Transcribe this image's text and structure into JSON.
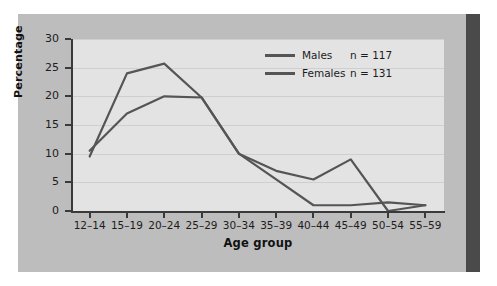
{
  "chart_data": {
    "type": "line",
    "title": "",
    "xlabel": "Age group",
    "ylabel": "Percentage",
    "categories": [
      "12–14",
      "15–19",
      "20–24",
      "25–29",
      "30–34",
      "35–39",
      "40–44",
      "45–49",
      "50–54",
      "55–59"
    ],
    "ylim": [
      0,
      30
    ],
    "yticks": [
      0,
      5,
      10,
      15,
      20,
      25,
      30
    ],
    "grid": true,
    "legend_position": "top-right",
    "series": [
      {
        "name": "Males",
        "n_label": "n = 117",
        "n": 117,
        "color": "#555555",
        "values": [
          10.5,
          17.0,
          20.0,
          19.8,
          10.0,
          7.0,
          5.5,
          9.0,
          0.0,
          1.0
        ]
      },
      {
        "name": "Females",
        "n_label": "n = 131",
        "n": 131,
        "color": "#555555",
        "values": [
          9.5,
          24.0,
          25.7,
          19.8,
          10.0,
          5.5,
          1.0,
          1.0,
          1.5,
          1.0
        ]
      }
    ]
  },
  "figure": {
    "panel_color": "#bdbdbd",
    "plot_color": "#e3e3e3",
    "accent_bar_color": "#4a4a4a",
    "axis_color": "#3a3a3a",
    "grid_color": "#cfcfcf"
  }
}
